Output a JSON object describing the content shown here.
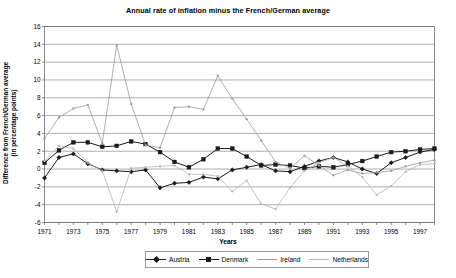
{
  "chart_data": {
    "type": "line",
    "title": "Annual rate of inflation minus the French/German average",
    "xlabel": "Years",
    "ylabel_line1": "Difference from French/German average",
    "ylabel_line2": "(in percentage points)",
    "ylim": [
      -6,
      16
    ],
    "ytick_step": 2,
    "yticks": [
      "16",
      "14",
      "12",
      "10",
      "8",
      "6",
      "4",
      "2",
      "0",
      "-2",
      "-4",
      "-6"
    ],
    "xlim": [
      1971,
      1998
    ],
    "xticks": [
      "1971",
      "1973",
      "1975",
      "1977",
      "1979",
      "1981",
      "1983",
      "1985",
      "1987",
      "1989",
      "1991",
      "1993",
      "1995",
      "1997"
    ],
    "x": [
      1971,
      1972,
      1973,
      1974,
      1975,
      1976,
      1977,
      1978,
      1979,
      1980,
      1981,
      1982,
      1983,
      1984,
      1985,
      1986,
      1987,
      1988,
      1989,
      1990,
      1991,
      1992,
      1993,
      1994,
      1995,
      1996,
      1997,
      1998
    ],
    "grid": true,
    "legend_position": "bottom",
    "series": [
      {
        "name": "Austria",
        "color": "#1a1a1a",
        "marker": "diamond",
        "values": [
          -1.0,
          1.3,
          1.7,
          0.6,
          -0.1,
          -0.2,
          -0.3,
          -0.1,
          -2.1,
          -1.6,
          -1.5,
          -0.9,
          -1.1,
          -0.1,
          0.2,
          0.5,
          -0.2,
          -0.3,
          0.3,
          0.9,
          1.3,
          0.8,
          0.0,
          -0.5,
          0.7,
          1.3,
          1.9,
          2.2
        ]
      },
      {
        "name": "Denmark",
        "color": "#1a1a1a",
        "marker": "square",
        "values": [
          0.7,
          2.1,
          3.0,
          3.0,
          2.5,
          2.6,
          3.1,
          2.8,
          1.9,
          0.8,
          0.2,
          1.1,
          2.3,
          2.3,
          1.4,
          0.4,
          0.5,
          0.4,
          0.1,
          0.3,
          0.2,
          0.5,
          0.9,
          1.4,
          1.9,
          2.0,
          2.2,
          2.3
        ]
      },
      {
        "name": "Ireland",
        "color": "#9a9a9a",
        "marker": "diamond",
        "values": [
          3.4,
          5.8,
          6.8,
          7.2,
          2.9,
          13.9,
          7.3,
          2.7,
          2.4,
          6.9,
          7.0,
          6.7,
          10.5,
          7.9,
          5.6,
          3.2,
          0.8,
          0.1,
          1.5,
          0.4,
          -0.7,
          -0.1,
          -0.5,
          -0.4,
          -0.2,
          0.3,
          0.7,
          1.0
        ]
      },
      {
        "name": "Netherlands",
        "color": "#b5b5b5",
        "marker": "diamond",
        "values": [
          0.9,
          2.6,
          2.3,
          0.7,
          -0.2,
          -4.8,
          0.1,
          0.2,
          0.3,
          0.4,
          -0.6,
          -0.6,
          -0.8,
          -2.5,
          -1.3,
          -3.9,
          -4.5,
          -2.1,
          -0.2,
          0.7,
          1.3,
          0.3,
          -0.9,
          -2.9,
          -1.9,
          -0.3,
          0.5,
          0.6
        ]
      }
    ]
  },
  "legend": {
    "items": [
      {
        "label": "Austria"
      },
      {
        "label": "Denmark"
      },
      {
        "label": "Ireland"
      },
      {
        "label": "Netherlands"
      }
    ]
  }
}
